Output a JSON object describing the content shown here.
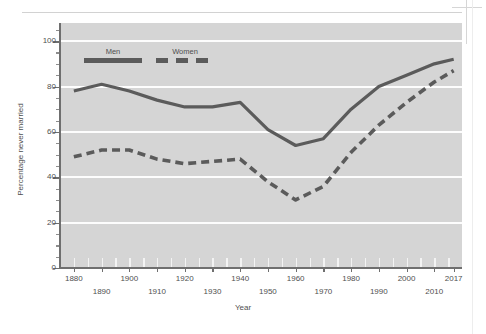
{
  "figure": {
    "y_axis_title": "Percentage never married",
    "x_axis_title": "Year"
  },
  "legend": {
    "position": "inside-top-left",
    "entries": [
      {
        "label": "Men",
        "style": "solid",
        "color": "#5b5b5b"
      },
      {
        "label": "Women",
        "style": "dashed",
        "color": "#5b5b5b"
      }
    ]
  },
  "axes": {
    "y_ticks": [
      "0",
      "20",
      "40",
      "60",
      "80",
      "100"
    ],
    "y_tick_values": [
      0,
      20,
      40,
      60,
      80,
      100
    ],
    "y_min": 0,
    "y_max": 108,
    "x_labels_top": [
      "1880",
      "1900",
      "1920",
      "1940",
      "1960",
      "1980",
      "2000",
      "2017"
    ],
    "x_labels_bottom": [
      "1890",
      "1910",
      "1930",
      "1950",
      "1970",
      "1990",
      "2010"
    ],
    "x_min": 1875,
    "x_max": 2020
  },
  "colors": {
    "plot_background": "#d5d5d5",
    "gridline": "#fdfdfd",
    "series": "#5b5b5b",
    "axis": "#6f6f6f",
    "text": "#4f4f4f"
  },
  "chart_data": {
    "type": "line",
    "title": "",
    "xlabel": "Year",
    "ylabel": "Percentage never married",
    "xlim": [
      1875,
      2020
    ],
    "ylim": [
      0,
      108
    ],
    "grid": true,
    "legend_position": "inside-top-left",
    "x": [
      1880,
      1890,
      1900,
      1910,
      1920,
      1930,
      1940,
      1950,
      1960,
      1970,
      1980,
      1990,
      2000,
      2010,
      2017
    ],
    "series": [
      {
        "name": "Men",
        "style": "solid",
        "values": [
          78,
          81,
          78,
          74,
          71,
          71,
          73,
          61,
          54,
          57,
          70,
          80,
          85,
          90,
          92
        ]
      },
      {
        "name": "Women",
        "style": "dashed",
        "values": [
          49,
          52,
          52,
          48,
          46,
          47,
          48,
          38,
          30,
          36,
          51,
          63,
          73,
          82,
          87
        ]
      }
    ]
  }
}
